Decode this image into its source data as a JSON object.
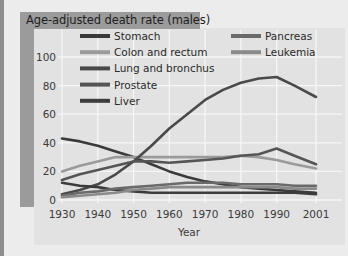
{
  "chart_data": {
    "type": "line",
    "title": "Age-adjusted death rate (males)",
    "xlabel": "Year",
    "ylabel": "",
    "xlim": [
      1930,
      2001
    ],
    "ylim": [
      0,
      100
    ],
    "x_ticks": [
      "1930",
      "1940",
      "1950",
      "1960",
      "1970",
      "1980",
      "1990",
      "2001"
    ],
    "y_ticks": [
      "0",
      "20",
      "40",
      "60",
      "80",
      "100"
    ],
    "grid": true,
    "legend_position": "top (inside plot, two columns)",
    "x": [
      1930,
      1935,
      1940,
      1945,
      1950,
      1955,
      1960,
      1965,
      1970,
      1975,
      1980,
      1985,
      1990,
      1995,
      2001
    ],
    "series": [
      {
        "name": "Stomach",
        "color": "#3a3a3a",
        "values": [
          43,
          41,
          38,
          34,
          30,
          25,
          20,
          16,
          13,
          11,
          9,
          8,
          7,
          6,
          5
        ]
      },
      {
        "name": "Colon and rectum",
        "color": "#9a9a9a",
        "values": [
          20,
          24,
          27,
          30,
          30,
          30,
          30,
          30,
          30,
          30,
          31,
          30,
          28,
          25,
          22
        ]
      },
      {
        "name": "Lung and bronchus",
        "color": "#4a4a4a",
        "values": [
          4,
          7,
          11,
          18,
          27,
          38,
          50,
          60,
          70,
          77,
          82,
          85,
          86,
          80,
          72
        ]
      },
      {
        "name": "Prostate",
        "color": "#555555",
        "values": [
          14,
          18,
          21,
          24,
          27,
          27,
          26,
          27,
          28,
          29,
          31,
          32,
          36,
          31,
          25
        ]
      },
      {
        "name": "Liver",
        "color": "#3c3c3c",
        "values": [
          12,
          10,
          9,
          7,
          6,
          5,
          5,
          5,
          5,
          5,
          5,
          5,
          5,
          5,
          4
        ]
      },
      {
        "name": "Pancreas",
        "color": "#6a6a6a",
        "values": [
          3,
          5,
          6,
          8,
          9,
          10,
          11,
          12,
          12,
          12,
          11,
          11,
          11,
          10,
          10
        ]
      },
      {
        "name": "Leukemia",
        "color": "#8a8a8a",
        "values": [
          2,
          3,
          4,
          5,
          7,
          8,
          9,
          9,
          9,
          9,
          9,
          9,
          9,
          8,
          8
        ]
      }
    ]
  },
  "header": {
    "title": "Age-adjusted death rate (males)"
  },
  "axes": {
    "x_label": "Year",
    "x_ticks": [
      "1930",
      "1940",
      "1950",
      "1960",
      "1970",
      "1980",
      "1990",
      "2001"
    ],
    "y_ticks": [
      "0",
      "20",
      "40",
      "60",
      "80",
      "100"
    ]
  },
  "legend": {
    "left": [
      "Stomach",
      "Colon and rectum",
      "Lung and bronchus",
      "Prostate",
      "Liver"
    ],
    "right": [
      "Pancreas",
      "Leukemia"
    ]
  }
}
